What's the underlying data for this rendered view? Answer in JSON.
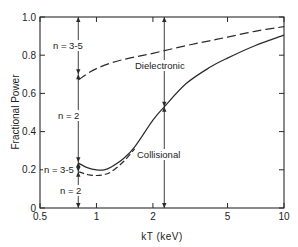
{
  "chart_data": {
    "type": "line",
    "title": "",
    "xlabel": "kT (keV)",
    "ylabel": "Fractional Power",
    "xscale": "log",
    "xlim": [
      0.5,
      10
    ],
    "ylim": [
      0,
      1.0
    ],
    "x_ticks": [
      {
        "value": 0.5,
        "label": "0.5"
      },
      {
        "value": 1,
        "label": "1"
      },
      {
        "value": 2,
        "label": "2"
      },
      {
        "value": 5,
        "label": "5"
      },
      {
        "value": 10,
        "label": "10"
      }
    ],
    "y_ticks": [
      {
        "value": 0,
        "label": "0"
      },
      {
        "value": 0.2,
        "label": "0.2"
      },
      {
        "value": 0.4,
        "label": "0.4"
      },
      {
        "value": 0.6,
        "label": "0.6"
      },
      {
        "value": 0.8,
        "label": "0.8"
      },
      {
        "value": 1.0,
        "label": "1.0"
      }
    ],
    "grid": false,
    "series": [
      {
        "name": "Dielectronic + collisional (n = 3-5 upper bound)",
        "style": "dashed",
        "x": [
          0.8,
          0.9,
          1.0,
          1.2,
          1.5,
          2.0,
          3.0,
          4.0,
          5.0,
          7.0,
          10.0
        ],
        "y": [
          0.67,
          0.705,
          0.73,
          0.76,
          0.785,
          0.81,
          0.85,
          0.875,
          0.895,
          0.925,
          0.95
        ]
      },
      {
        "name": "Collisional (upper, includes n = 3-5)",
        "style": "solid",
        "x": [
          0.8,
          0.9,
          1.0,
          1.1,
          1.2,
          1.4,
          1.6,
          2.0,
          2.3,
          3.0,
          4.0,
          5.0,
          7.0,
          10.0
        ],
        "y": [
          0.235,
          0.21,
          0.2,
          0.2,
          0.215,
          0.26,
          0.32,
          0.46,
          0.53,
          0.65,
          0.735,
          0.785,
          0.85,
          0.905
        ]
      },
      {
        "name": "Collisional (n = 2 only)",
        "style": "dashed",
        "x": [
          0.8,
          0.9,
          1.0,
          1.1,
          1.2,
          1.4,
          1.6
        ],
        "y": [
          0.19,
          0.175,
          0.17,
          0.175,
          0.19,
          0.245,
          0.31
        ]
      }
    ],
    "annotations": [
      {
        "text": "n = 3-5",
        "x": 0.62,
        "y": 0.9
      },
      {
        "text": "n = 2",
        "x": 0.65,
        "y": 0.45
      },
      {
        "text": "n = 3-5",
        "x": 0.58,
        "y": 0.2
      },
      {
        "text": "n = 2",
        "x": 0.68,
        "y": 0.06
      },
      {
        "text": "Dielectronic",
        "x": 2.0,
        "y": 0.68
      },
      {
        "text": "Collisional",
        "x": 2.0,
        "y": 0.28
      }
    ],
    "arrows": [
      {
        "x": 0.8,
        "y_from": 1.0,
        "y_to": 0.7,
        "label": "n = 3-5"
      },
      {
        "x": 0.8,
        "y_from": 0.7,
        "y_to": 0.24,
        "label": "n = 2"
      },
      {
        "x": 0.8,
        "y_from": 0.24,
        "y_to": 0.19,
        "label": "n = 3-5"
      },
      {
        "x": 0.8,
        "y_from": 0.19,
        "y_to": 0.0,
        "label": "n = 2"
      },
      {
        "x": 2.3,
        "y_from": 1.0,
        "y_to": 0.53,
        "label": "Dielectronic"
      },
      {
        "x": 2.3,
        "y_from": 0.53,
        "y_to": 0.0,
        "label": "Collisional"
      }
    ],
    "legend": "none"
  }
}
